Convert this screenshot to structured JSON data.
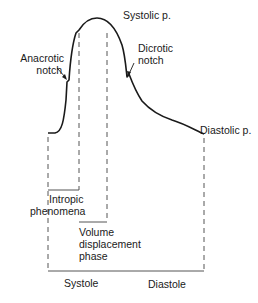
{
  "figure": {
    "type": "arterial pressure waveform diagram",
    "labels": {
      "systolic_peak": "Systolic p.",
      "anacrotic_notch": [
        "Anacrotic",
        "notch"
      ],
      "dicrotic_notch": [
        "Dicrotic",
        "notch"
      ],
      "diastolic_pressure": "Diastolic p.",
      "intropic": [
        "Intropic",
        "phenomena"
      ],
      "volume_displacement": [
        "Volume",
        "displacement",
        "phase"
      ],
      "systole": "Systole",
      "diastole": "Diastole"
    },
    "colors": {
      "line": "#1a1a1a",
      "dashed": "#555555",
      "background": "#ffffff"
    }
  }
}
